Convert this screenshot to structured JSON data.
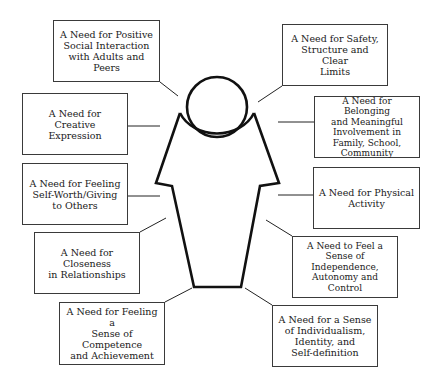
{
  "diagram": {
    "title": "",
    "center_figure": "person-outline",
    "needs": [
      {
        "id": "positive-social-interaction",
        "label": "A Need for Positive\nSocial Interaction\nwith Adults and\nPeers",
        "side": "left"
      },
      {
        "id": "safety-structure",
        "label": "A Need for Safety,\nStructure and Clear\nLimits",
        "side": "right"
      },
      {
        "id": "creative-expression",
        "label": "A Need for Creative\nExpression",
        "side": "left"
      },
      {
        "id": "belonging",
        "label": "A Need for Belonging\nand Meaningful\nInvolvement in\nFamily, School,\nCommunity",
        "side": "right"
      },
      {
        "id": "self-worth",
        "label": "A Need for Feeling\nSelf-Worth/Giving\nto Others",
        "side": "left"
      },
      {
        "id": "physical-activity",
        "label": "A Need for Physical\nActivity",
        "side": "right"
      },
      {
        "id": "closeness",
        "label": "A Need for Closeness\nin Relationships",
        "side": "left"
      },
      {
        "id": "independence",
        "label": "A Need to Feel a\nSense of\nIndependence,\nAutonomy and\nControl",
        "side": "right"
      },
      {
        "id": "competence",
        "label": "A Need for Feeling a\nSense of Competence\nand Achievement",
        "side": "left"
      },
      {
        "id": "individualism",
        "label": "A Need for a Sense\nof Individualism,\nIdentity, and\nSelf-definition",
        "side": "right"
      }
    ]
  },
  "colors": {
    "line": "#111111",
    "box_border": "#3a3a3a",
    "text": "#1a1a1a",
    "background": "#ffffff"
  }
}
